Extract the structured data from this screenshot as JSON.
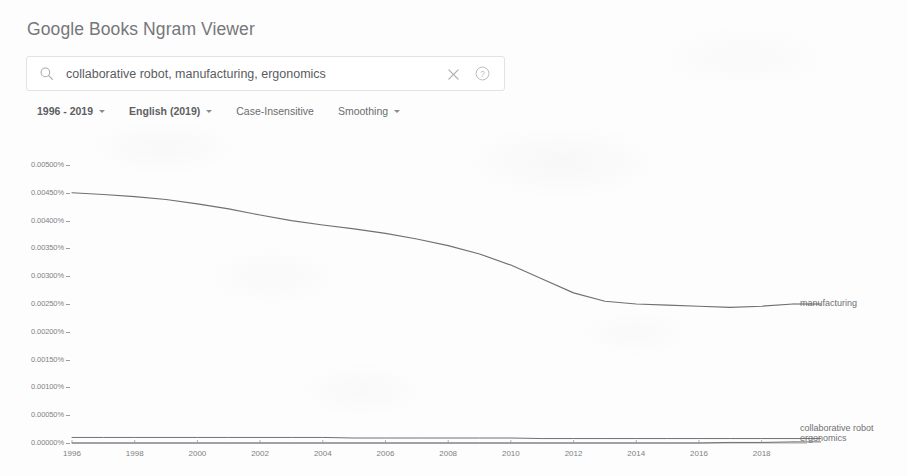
{
  "app": {
    "title": "Google Books Ngram Viewer"
  },
  "search": {
    "value": "collaborative robot, manufacturing, ergonomics",
    "placeholder": "Enter comma-separated phrases",
    "search_icon": "search-icon",
    "clear_icon": "close-icon",
    "help_icon": "help-circle-icon"
  },
  "controls": {
    "date_range": "1996 - 2019",
    "corpus": "English (2019)",
    "case": "Case-Insensitive",
    "smoothing": "Smoothing"
  },
  "colors": {
    "line": "#6e7074",
    "text": "#7e7f82",
    "title": "#76777a",
    "border": "#e2e3e5",
    "background": "#fdfdfd"
  },
  "chart_data": {
    "type": "line",
    "title": "",
    "xlabel": "",
    "ylabel": "",
    "xlim": [
      1996,
      2019
    ],
    "ylim": [
      0.0,
      0.005
    ],
    "grid": false,
    "legend_position": "right-of-plot",
    "ytick_labels": [
      "0.00500%",
      "0.00450%",
      "0.00400%",
      "0.00350%",
      "0.00300%",
      "0.00250%",
      "0.00200%",
      "0.00150%",
      "0.00100%",
      "0.00050%",
      "0.00000%"
    ],
    "ytick_values": [
      0.005,
      0.0045,
      0.004,
      0.0035,
      0.003,
      0.0025,
      0.002,
      0.0015,
      0.001,
      0.0005,
      0.0
    ],
    "xtick_labels": [
      "1996",
      "1998",
      "2000",
      "2002",
      "2004",
      "2006",
      "2008",
      "2010",
      "2012",
      "2014",
      "2016",
      "2018"
    ],
    "xtick_values": [
      1996,
      1998,
      2000,
      2002,
      2004,
      2006,
      2008,
      2010,
      2012,
      2014,
      2016,
      2018
    ],
    "x": [
      1996,
      1997,
      1998,
      1999,
      2000,
      2001,
      2002,
      2003,
      2004,
      2005,
      2006,
      2007,
      2008,
      2009,
      2010,
      2011,
      2012,
      2013,
      2014,
      2015,
      2016,
      2017,
      2018,
      2019
    ],
    "series": [
      {
        "name": "manufacturing",
        "values": [
          0.0045,
          0.00447,
          0.00443,
          0.00438,
          0.0043,
          0.00421,
          0.0041,
          0.004,
          0.00392,
          0.00385,
          0.00377,
          0.00367,
          0.00355,
          0.0034,
          0.0032,
          0.00295,
          0.0027,
          0.00255,
          0.0025,
          0.00248,
          0.00246,
          0.00244,
          0.00246,
          0.0025
        ]
      },
      {
        "name": "ergonomics",
        "values": [
          0.0001,
          0.0001,
          0.0001,
          0.0001,
          0.0001,
          0.0001,
          0.0001,
          0.0001,
          0.0001,
          9e-05,
          9e-05,
          9e-05,
          9e-05,
          9e-05,
          9e-05,
          8e-05,
          8e-05,
          8e-05,
          8e-05,
          8e-05,
          8e-05,
          8e-05,
          8e-05,
          8e-05
        ]
      },
      {
        "name": "collaborative robot",
        "values": [
          0.0,
          0.0,
          0.0,
          0.0,
          0.0,
          0.0,
          0.0,
          0.0,
          0.0,
          0.0,
          0.0,
          0.0,
          0.0,
          0.0,
          0.0,
          0.0,
          0.0,
          0.0,
          0.0,
          0.0,
          0.0,
          1e-05,
          1e-05,
          2e-05
        ]
      }
    ]
  }
}
